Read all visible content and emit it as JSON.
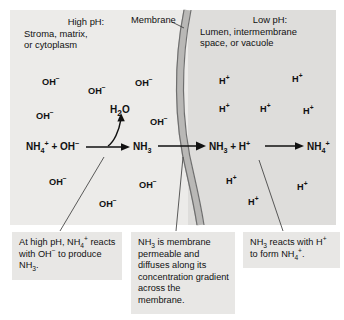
{
  "figure": {
    "colors": {
      "left_compartment": "#ecebe9",
      "right_compartment": "#dedddb",
      "membrane_line": "#6f6f6f",
      "membrane_fill": "#b9b8b6",
      "caption_box": "#e8e7e5",
      "text": "#111111",
      "background": "#ffffff"
    }
  },
  "headers": {
    "left": {
      "title": "High pH:",
      "line1": "Stroma, matrix,",
      "line2": "or cytoplasm"
    },
    "right": {
      "title": "Low pH:",
      "line1": "Lumen, intermembrane",
      "line2": "space, or vacuole"
    },
    "membrane_label": "Membrane"
  },
  "ions": {
    "left": [
      {
        "label": "OH",
        "charge": "−",
        "x": 42,
        "y": 77
      },
      {
        "label": "OH",
        "charge": "−",
        "x": 88,
        "y": 86
      },
      {
        "label": "OH",
        "charge": "−",
        "x": 135,
        "y": 78
      },
      {
        "label": "OH",
        "charge": "−",
        "x": 36,
        "y": 111
      },
      {
        "label": "OH",
        "charge": "−",
        "x": 150,
        "y": 117
      },
      {
        "label": "OH",
        "charge": "−",
        "x": 49,
        "y": 177
      },
      {
        "label": "OH",
        "charge": "−",
        "x": 139,
        "y": 180
      },
      {
        "label": "OH",
        "charge": "−",
        "x": 99,
        "y": 199
      }
    ],
    "right": [
      {
        "label": "H",
        "charge": "+",
        "x": 219,
        "y": 76
      },
      {
        "label": "H",
        "charge": "+",
        "x": 292,
        "y": 74
      },
      {
        "label": "H",
        "charge": "+",
        "x": 219,
        "y": 104
      },
      {
        "label": "H",
        "charge": "+",
        "x": 260,
        "y": 104
      },
      {
        "label": "H",
        "charge": "+",
        "x": 303,
        "y": 106
      },
      {
        "label": "H",
        "charge": "+",
        "x": 226,
        "y": 176
      },
      {
        "label": "H",
        "charge": "+",
        "x": 297,
        "y": 182
      },
      {
        "label": "H",
        "charge": "+",
        "x": 248,
        "y": 197
      }
    ]
  },
  "reaction": {
    "term1_html": "NH<sub>4</sub><sup>+</sup> + OH<sup>−</sup>",
    "term1_text": "NH4+ + OH-",
    "byproduct_html": "H<sub>2</sub>O",
    "byproduct_text": "H2O",
    "term2_html": "NH<sub>3</sub>",
    "term2_text": "NH3",
    "term3_html": "NH<sub>3</sub> + H<sup>+</sup>",
    "term3_text": "NH3 + H+",
    "term4_html": "NH<sub>4</sub><sup>+</sup>",
    "term4_text": "NH4+"
  },
  "captions": [
    {
      "id": "caption-high-ph",
      "html": "At high pH, NH<sub>4</sub><sup>+</sup> reacts with OH<sup>−</sup> to produce NH<sub>3</sub>.",
      "text": "At high pH, NH4+ reacts with OH- to produce NH3."
    },
    {
      "id": "caption-membrane-permeable",
      "html": "NH<sub>3</sub> is membrane permeable and diffuses along its concentration gradient across the membrane.",
      "text": "NH3 is membrane permeable and diffuses along its concentration gradient across the membrane."
    },
    {
      "id": "caption-low-ph",
      "html": "NH<sub>3</sub> reacts with H<sup>+</sup> to form NH<sub>4</sub><sup>+</sup>.",
      "text": "NH3 reacts with H+ to form NH4+."
    }
  ]
}
